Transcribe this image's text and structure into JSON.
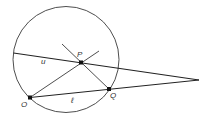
{
  "diagram": {
    "type": "geometry",
    "colors": {
      "stroke": "#3a3a3a",
      "point": "#111111",
      "label": "#333333",
      "background": "#ffffff"
    },
    "circle": {
      "cx": 66,
      "cy": 59.5,
      "r": 53
    },
    "points": {
      "P": {
        "label": "P",
        "x": 81,
        "y": 62.5
      },
      "O": {
        "label": "O",
        "x": 30,
        "y": 97.5
      },
      "Q": {
        "label": "Q",
        "x": 109,
        "y": 89
      },
      "apex": {
        "x": 199,
        "y": 80
      }
    },
    "lines": {
      "u": {
        "label": "u",
        "label_x": 41,
        "label_y": 64
      },
      "l": {
        "label": "ℓ",
        "label_x": 71,
        "label_y": 103
      }
    },
    "labels": {
      "P": {
        "text": "P",
        "x": 77,
        "y": 57
      },
      "O": {
        "text": "O",
        "x": 21,
        "y": 107
      },
      "Q": {
        "text": "Q",
        "x": 110,
        "y": 98
      }
    }
  }
}
